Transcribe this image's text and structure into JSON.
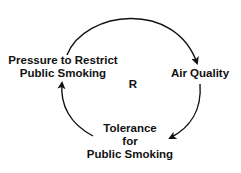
{
  "diagram": {
    "type": "causal-loop",
    "loop_label": "R",
    "nodes": [
      {
        "id": "pressure",
        "lines": [
          "Pressure to Restrict",
          "Public Smoking"
        ]
      },
      {
        "id": "air",
        "lines": [
          "Air Quality"
        ]
      },
      {
        "id": "tolerance",
        "lines": [
          "Tolerance",
          "for",
          "Public Smoking"
        ]
      }
    ],
    "links": [
      {
        "from": "pressure",
        "to": "air"
      },
      {
        "from": "air",
        "to": "tolerance"
      },
      {
        "from": "tolerance",
        "to": "pressure"
      }
    ],
    "colors": {
      "stroke": "#111111",
      "text": "#111111",
      "background": "#ffffff"
    }
  }
}
